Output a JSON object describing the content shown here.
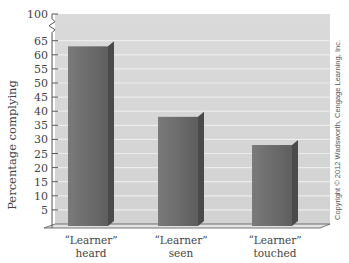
{
  "chart_data": {
    "type": "bar",
    "title": "",
    "xlabel": "",
    "ylabel": "Percentage complying",
    "categories": [
      "“Learner” heard",
      "“Learner” seen",
      "“Learner” touched"
    ],
    "category_lines": [
      [
        "“Learner”",
        "heard"
      ],
      [
        "“Learner”",
        "seen"
      ],
      [
        "“Learner”",
        "touched"
      ]
    ],
    "values": [
      63,
      38,
      28
    ],
    "ylim": [
      0,
      100
    ],
    "yticks": [
      5,
      10,
      15,
      20,
      25,
      30,
      35,
      40,
      45,
      50,
      55,
      60,
      65,
      100
    ],
    "axis_break": "between 65 and 100",
    "grid": true,
    "legend": null,
    "style": "3d-bars"
  },
  "annotations": {
    "copyright": "Copyright © 2012 Wadsworth, Cengage Learning, Inc."
  },
  "colors": {
    "plot_background": "#d4d4d4",
    "gridline": "#ececec",
    "bar_front": "#6e6e6e",
    "bar_side": "#4a4a4a",
    "axis": "#555555"
  }
}
